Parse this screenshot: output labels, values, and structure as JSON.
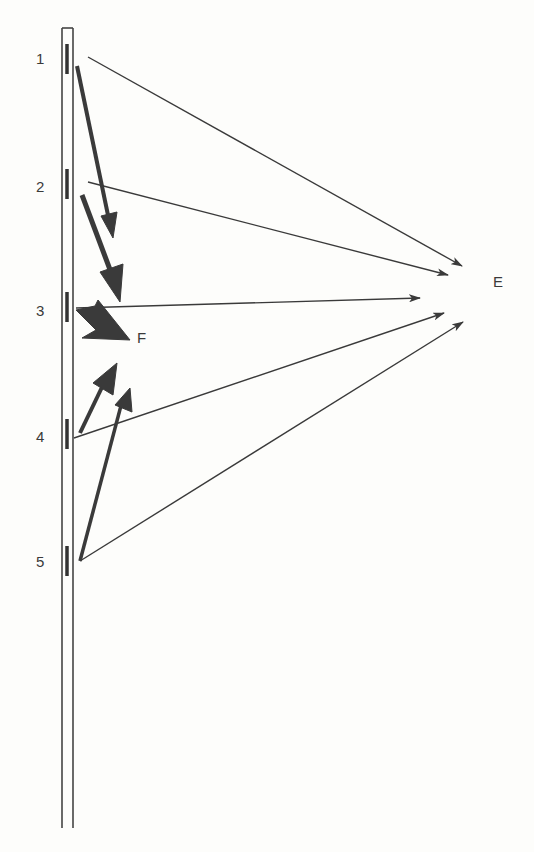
{
  "diagram": {
    "element_labels": [
      "1",
      "2",
      "3",
      "4",
      "5"
    ],
    "far_point_label": "E",
    "near_point_label": "F",
    "colors": {
      "line": "#3a3a3a",
      "background": "#fdfdfb"
    }
  }
}
